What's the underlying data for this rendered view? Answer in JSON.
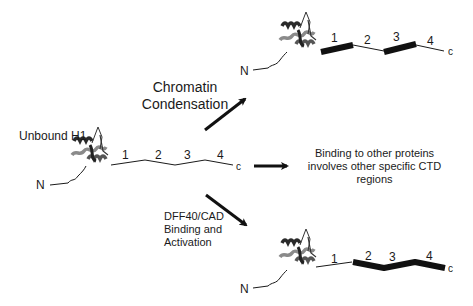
{
  "diagram": {
    "unbound": {
      "label": "Unbound H1",
      "n_terminus": "N",
      "c_terminus": "c",
      "regions": [
        "1",
        "2",
        "3",
        "4"
      ]
    },
    "top_pathway": {
      "label_line1": "Chromatin",
      "label_line2": "Condensation",
      "n_terminus": "N",
      "c_terminus": "c",
      "regions": [
        "1",
        "2",
        "3",
        "4"
      ],
      "structured_regions": [
        "1",
        "3"
      ]
    },
    "middle_pathway": {
      "label_line1": "Binding to other proteins",
      "label_line2": "involves other specific CTD",
      "label_line3": "regions"
    },
    "bottom_pathway": {
      "label_line1": "DFF40/CAD",
      "label_line2": "Binding and",
      "label_line3": "Activation",
      "n_terminus": "N",
      "c_terminus": "c",
      "regions": [
        "1",
        "2",
        "3",
        "4"
      ],
      "structured_regions": [
        "2",
        "3",
        "4"
      ]
    },
    "colors": {
      "line": "#1a1a1a",
      "protein_dark": "#2a2a2a",
      "protein_light": "#8a8a8a"
    }
  }
}
